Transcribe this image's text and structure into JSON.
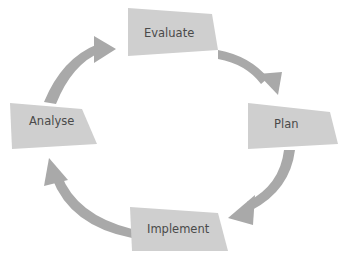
{
  "diagram": {
    "type": "cycle",
    "colors": {
      "box": "#cfcfcf",
      "arrow": "#a9a9a9",
      "text": "#4a4a4a",
      "background": "#ffffff"
    },
    "stages": [
      {
        "id": "evaluate",
        "label": "Evaluate"
      },
      {
        "id": "plan",
        "label": "Plan"
      },
      {
        "id": "implement",
        "label": "Implement"
      },
      {
        "id": "analyse",
        "label": "Analyse"
      }
    ],
    "edges": [
      {
        "from": "Evaluate",
        "to": "Plan"
      },
      {
        "from": "Plan",
        "to": "Implement"
      },
      {
        "from": "Implement",
        "to": "Analyse"
      },
      {
        "from": "Analyse",
        "to": "Evaluate"
      }
    ]
  }
}
